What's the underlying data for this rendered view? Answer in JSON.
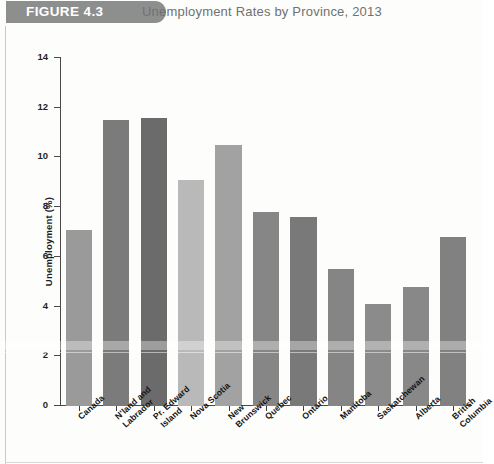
{
  "header": {
    "figure_badge": "FIGURE 4.3",
    "title": "Unemployment Rates by Province, 2013"
  },
  "chart_data": {
    "type": "bar",
    "title": "Unemployment Rates by Province, 2013",
    "xlabel": "",
    "ylabel": "Unemployment (%)",
    "ylim": [
      0,
      14
    ],
    "yticks": [
      0,
      2,
      4,
      6,
      8,
      10,
      12,
      14
    ],
    "grid": false,
    "legend": "none",
    "categories": [
      "Canada",
      "N'land and\nLabrador",
      "Pr. Edward\nIsland",
      "Nova Scotia",
      "New\nBrunswick",
      "Quebec",
      "Ontario",
      "Manitoba",
      "Saskatchewan",
      "Alberta",
      "British\nColumbia"
    ],
    "values": [
      7.1,
      11.5,
      11.6,
      9.1,
      10.5,
      7.8,
      7.6,
      5.5,
      4.1,
      4.8,
      6.8
    ],
    "bar_colors": [
      "#9a9a9a",
      "#7b7b7b",
      "#6b6b6b",
      "#b9b9b9",
      "#a2a2a2",
      "#868686",
      "#797979",
      "#858585",
      "#8b8b8b",
      "#888888",
      "#818181"
    ]
  },
  "colors": {
    "badge": "#8d8f8e",
    "badge_text": "#ffffff",
    "title_text": "#6e7271",
    "axis": "#4a4a4a",
    "tick_text": "#1f1f1f",
    "background": "#fdfdfc"
  }
}
